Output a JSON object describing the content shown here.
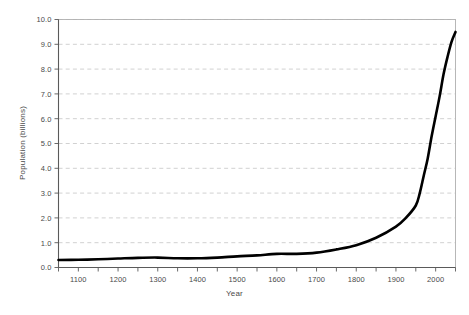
{
  "chart_data": {
    "type": "line",
    "title": "",
    "xlabel": "Year",
    "ylabel": "Population (billions)",
    "xlim": [
      1050,
      2050
    ],
    "ylim": [
      0.0,
      10.0
    ],
    "grid": true,
    "grid_axis": "y",
    "legend": "none",
    "line_color": "#000000",
    "line_width": 2.6,
    "grid_color": "#cccccc",
    "frame_color": "#b0b0b0",
    "tick_label_color": "#4a4a4a",
    "x_ticks_major": [
      1100,
      1200,
      1300,
      1400,
      1500,
      1600,
      1700,
      1800,
      1900,
      2000
    ],
    "x_tick_labels": [
      "1100",
      "1200",
      "1300",
      "1400",
      "1500",
      "1600",
      "1700",
      "1800",
      "1900",
      "2000"
    ],
    "x_ticks_minor": [
      1050,
      1150,
      1250,
      1350,
      1450,
      1550,
      1650,
      1750,
      1850,
      1950,
      2050
    ],
    "y_ticks": [
      0.0,
      1.0,
      2.0,
      3.0,
      4.0,
      5.0,
      6.0,
      7.0,
      8.0,
      9.0,
      10.0
    ],
    "y_tick_labels": [
      "0.0",
      "1.0",
      "2.0",
      "3.0",
      "4.0",
      "5.0",
      "6.0",
      "7.0",
      "8.0",
      "9.0",
      "10.0"
    ],
    "series": [
      {
        "name": "World population",
        "x": [
          1050,
          1100,
          1150,
          1200,
          1250,
          1300,
          1350,
          1400,
          1450,
          1500,
          1550,
          1600,
          1650,
          1700,
          1750,
          1800,
          1850,
          1900,
          1925,
          1950,
          1960,
          1970,
          1980,
          1990,
          2000,
          2010,
          2020,
          2030,
          2040,
          2050
        ],
        "values": [
          0.3,
          0.31,
          0.33,
          0.36,
          0.39,
          0.4,
          0.37,
          0.37,
          0.4,
          0.45,
          0.49,
          0.55,
          0.55,
          0.6,
          0.73,
          0.9,
          1.2,
          1.65,
          2.0,
          2.5,
          3.0,
          3.7,
          4.4,
          5.3,
          6.1,
          6.9,
          7.8,
          8.5,
          9.1,
          9.5
        ]
      }
    ]
  },
  "axes": {
    "xlabel": "Year",
    "ylabel": "Population (billions)"
  }
}
